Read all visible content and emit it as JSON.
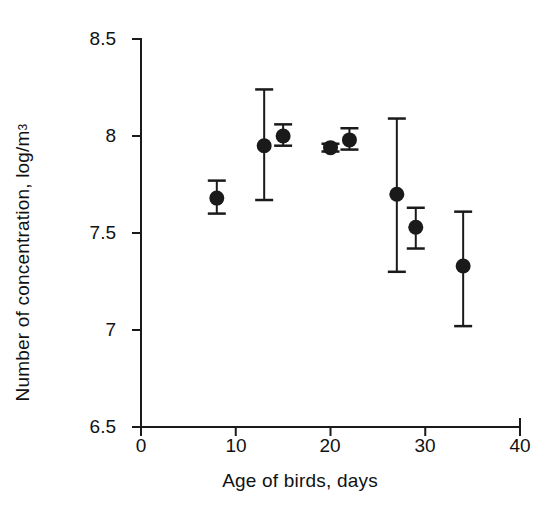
{
  "chart_data": {
    "type": "scatter",
    "title": "",
    "xlabel": "Age of birds, days",
    "ylabel": "Number of concentration, log/m",
    "ylabel_superscript": "3",
    "xlim": [
      0,
      40
    ],
    "ylim": [
      6.5,
      8.5
    ],
    "xticks": [
      0,
      10,
      20,
      30,
      40
    ],
    "xtick_labels": [
      "0",
      "10",
      "20",
      "30",
      "40"
    ],
    "yticks": [
      6.5,
      7,
      7.5,
      8,
      8.5
    ],
    "ytick_labels": [
      "6.5",
      "7",
      "7.5",
      "8",
      "8.5"
    ],
    "grid": false,
    "legend": false,
    "marker": "filled-circle",
    "error_bars": "vertical-with-caps",
    "series": [
      {
        "name": "Number of concentration",
        "x": [
          8,
          13,
          15,
          20,
          22,
          27,
          29,
          34
        ],
        "y": [
          7.68,
          7.95,
          8.0,
          7.94,
          7.98,
          7.7,
          7.53,
          7.33
        ],
        "yerr_low": [
          7.6,
          7.67,
          7.95,
          7.92,
          7.93,
          7.3,
          7.42,
          7.02
        ],
        "yerr_high": [
          7.77,
          8.24,
          8.06,
          7.96,
          8.04,
          8.09,
          7.63,
          7.61
        ]
      }
    ]
  },
  "axes": {
    "color": "#1a1a1a",
    "line_width": 2
  }
}
